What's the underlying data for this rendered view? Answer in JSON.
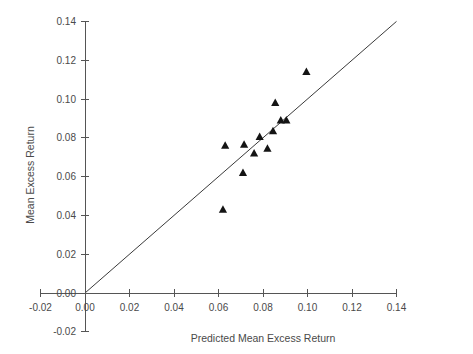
{
  "chart_data": {
    "type": "scatter",
    "title": "",
    "xlabel": "Predicted Mean Excess Return",
    "ylabel": "Mean Excess Return",
    "xlim": [
      -0.02,
      0.14
    ],
    "ylim": [
      -0.02,
      0.14
    ],
    "xticks": [
      -0.02,
      0.0,
      0.02,
      0.04,
      0.06,
      0.08,
      0.1,
      0.12,
      0.14
    ],
    "yticks": [
      -0.02,
      0.0,
      0.02,
      0.04,
      0.06,
      0.08,
      0.1,
      0.12,
      0.14
    ],
    "xtick_labels": [
      "-0.02",
      "0.00",
      "0.02",
      "0.04",
      "0.06",
      "0.08",
      "0.10",
      "0.12",
      "0.14"
    ],
    "ytick_labels": [
      "-0.02",
      "0.00",
      "0.02",
      "0.04",
      "0.06",
      "0.08",
      "0.10",
      "0.12",
      "0.14"
    ],
    "grid": false,
    "legend": "none",
    "marker_shape": "triangle",
    "marker_color": "#141414",
    "series": [
      {
        "name": "Portfolios",
        "marker": "triangle",
        "points": [
          {
            "x": 0.062,
            "y": 0.043
          },
          {
            "x": 0.063,
            "y": 0.076
          },
          {
            "x": 0.071,
            "y": 0.062
          },
          {
            "x": 0.0715,
            "y": 0.0765
          },
          {
            "x": 0.076,
            "y": 0.072
          },
          {
            "x": 0.0785,
            "y": 0.0805
          },
          {
            "x": 0.082,
            "y": 0.0745
          },
          {
            "x": 0.0845,
            "y": 0.0835
          },
          {
            "x": 0.0855,
            "y": 0.098
          },
          {
            "x": 0.088,
            "y": 0.089
          },
          {
            "x": 0.0905,
            "y": 0.089
          },
          {
            "x": 0.0995,
            "y": 0.114
          }
        ]
      }
    ],
    "reference_line": {
      "name": "45-degree line",
      "type": "line",
      "description": "y = x",
      "from": {
        "x": 0.0,
        "y": 0.0
      },
      "to": {
        "x": 0.14,
        "y": 0.14
      },
      "color": "#3a3a3a"
    }
  },
  "axes": {
    "x_axis_title": "Predicted Mean Excess Return",
    "y_axis_title": "Mean Excess Return"
  }
}
